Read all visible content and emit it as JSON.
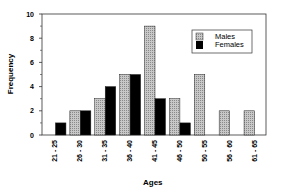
{
  "chart_data": {
    "type": "bar",
    "title": "",
    "xlabel": "Ages",
    "ylabel": "Frequency",
    "ylim": [
      0,
      10
    ],
    "yticks": [
      0,
      2,
      4,
      6,
      8,
      10
    ],
    "grid": false,
    "legend_position": "upper right",
    "categories": [
      "21 - 25",
      "26 - 30",
      "31 - 35",
      "36 - 40",
      "41 - 45",
      "46 - 50",
      "50 - 55",
      "56 - 60",
      "61 - 65"
    ],
    "series": [
      {
        "name": "Males",
        "values": [
          0,
          2,
          3,
          5,
          9,
          3,
          5,
          2,
          2
        ],
        "color": "#b0b0b0"
      },
      {
        "name": "Females",
        "values": [
          1,
          2,
          4,
          5,
          3,
          1,
          0,
          0,
          0
        ],
        "color": "#000000"
      }
    ]
  }
}
